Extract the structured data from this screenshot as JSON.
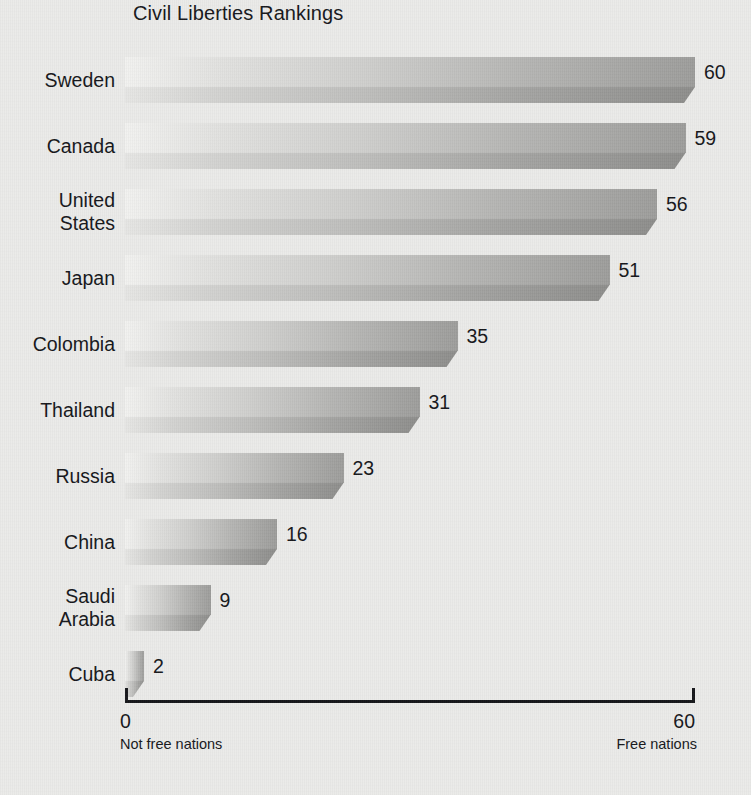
{
  "chart_data": {
    "type": "bar",
    "orientation": "horizontal",
    "title": "Civil Liberties Rankings",
    "xlabel": "",
    "ylabel": "",
    "xlim": [
      0,
      60
    ],
    "grid": false,
    "legend": null,
    "categories": [
      "Sweden",
      "Canada",
      "United States",
      "Japan",
      "Colombia",
      "Thailand",
      "Russia",
      "China",
      "Saudi Arabia",
      "Cuba"
    ],
    "values": [
      60,
      59,
      56,
      51,
      35,
      31,
      23,
      16,
      9,
      2
    ],
    "value_labels": [
      "60",
      "59",
      "56",
      "51",
      "35",
      "31",
      "23",
      "16",
      "9",
      "2"
    ],
    "axis": {
      "min_tick": "0",
      "max_tick": "60",
      "left_caption": "Not free nations",
      "right_caption": "Free nations"
    },
    "style": {
      "background": "#ebebe9",
      "bar_light": "#f2f2f0",
      "bar_dark": "#9d9d9b",
      "text": "#15161a",
      "axis_color": "#16171b"
    }
  },
  "rows": [
    {
      "label": "Sweden",
      "value_label": "60"
    },
    {
      "label": "Canada",
      "value_label": "59"
    },
    {
      "label": "United\nStates",
      "value_label": "56"
    },
    {
      "label": "Japan",
      "value_label": "51"
    },
    {
      "label": "Colombia",
      "value_label": "35"
    },
    {
      "label": "Thailand",
      "value_label": "31"
    },
    {
      "label": "Russia",
      "value_label": "23"
    },
    {
      "label": "China",
      "value_label": "16"
    },
    {
      "label": "Saudi\nArabia",
      "value_label": "9"
    },
    {
      "label": "Cuba",
      "value_label": "2"
    }
  ]
}
